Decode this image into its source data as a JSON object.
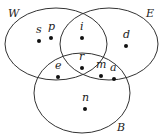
{
  "diagram": {
    "type": "venn",
    "sets": [
      {
        "name": "W",
        "cx": 56,
        "cy": 44,
        "rx": 51,
        "ry": 36,
        "label_x": 10,
        "label_y": 17
      },
      {
        "name": "E",
        "cx": 109,
        "cy": 44,
        "rx": 49,
        "ry": 36,
        "label_x": 148,
        "label_y": 17
      },
      {
        "name": "B",
        "cx": 82,
        "cy": 93,
        "rx": 48,
        "ry": 40,
        "label_x": 118,
        "label_y": 131
      }
    ],
    "elements": [
      {
        "label": "s",
        "x": 39,
        "y": 41,
        "lx": 37,
        "ly": 33,
        "region": "W only"
      },
      {
        "label": "p",
        "x": 51,
        "y": 38,
        "lx": 49,
        "ly": 30,
        "region": "W only"
      },
      {
        "label": "i",
        "x": 82,
        "y": 38,
        "lx": 80,
        "ly": 30,
        "region": "W ∩ E"
      },
      {
        "label": "d",
        "x": 126,
        "y": 46,
        "lx": 124,
        "ly": 38,
        "region": "E only"
      },
      {
        "label": "r",
        "x": 82,
        "y": 68,
        "lx": 80,
        "ly": 60,
        "region": "W ∩ E ∩ B"
      },
      {
        "label": "e",
        "x": 58,
        "y": 77,
        "lx": 56,
        "ly": 69,
        "region": "W ∩ B"
      },
      {
        "label": "m",
        "x": 101,
        "y": 76,
        "lx": 97,
        "ly": 68,
        "region": "E ∩ B"
      },
      {
        "label": "a",
        "x": 114,
        "y": 79,
        "lx": 111,
        "ly": 71,
        "region": "E ∩ B"
      },
      {
        "label": "n",
        "x": 85,
        "y": 109,
        "lx": 82,
        "ly": 101,
        "region": "B only"
      }
    ]
  }
}
